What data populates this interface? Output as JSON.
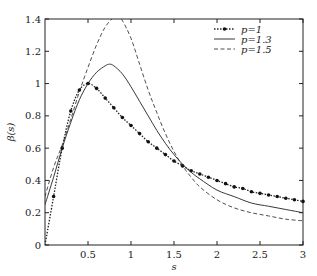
{
  "chart_data": {
    "type": "line",
    "title": "",
    "xlabel": "s",
    "ylabel": "β(s)",
    "xlim": [
      0,
      3
    ],
    "ylim": [
      0,
      1.4
    ],
    "grid": false,
    "legend_position": "upper right",
    "x_ticks": [
      "0.5",
      "1",
      "1.5",
      "2",
      "2.5",
      "3"
    ],
    "y_ticks": [
      "0",
      "0.2",
      "0.4",
      "0.6",
      "0.8",
      "1",
      "1.2",
      "1.4"
    ],
    "series": [
      {
        "name": "p=1",
        "style": "dotted-markers",
        "x": [
          0,
          0.1,
          0.2,
          0.3,
          0.4,
          0.5,
          0.6,
          0.7,
          0.8,
          0.9,
          1.0,
          1.1,
          1.2,
          1.3,
          1.4,
          1.5,
          1.6,
          1.7,
          1.8,
          1.9,
          2.0,
          2.1,
          2.2,
          2.3,
          2.4,
          2.5,
          2.6,
          2.7,
          2.8,
          2.9,
          3.0
        ],
        "values": [
          0,
          0.3,
          0.6,
          0.83,
          0.96,
          1.0,
          0.97,
          0.91,
          0.85,
          0.79,
          0.74,
          0.69,
          0.64,
          0.6,
          0.56,
          0.52,
          0.49,
          0.46,
          0.44,
          0.42,
          0.4,
          0.38,
          0.36,
          0.35,
          0.33,
          0.32,
          0.31,
          0.3,
          0.29,
          0.28,
          0.27
        ]
      },
      {
        "name": "p=1.3",
        "style": "solid",
        "x": [
          0,
          0.1,
          0.2,
          0.3,
          0.4,
          0.5,
          0.6,
          0.7,
          0.75,
          0.8,
          0.9,
          1.0,
          1.1,
          1.2,
          1.3,
          1.4,
          1.5,
          1.6,
          1.7,
          1.8,
          2.0,
          2.2,
          2.4,
          2.6,
          2.8,
          3.0
        ],
        "values": [
          0.25,
          0.42,
          0.6,
          0.76,
          0.9,
          1.0,
          1.07,
          1.11,
          1.12,
          1.11,
          1.06,
          0.98,
          0.89,
          0.8,
          0.71,
          0.63,
          0.56,
          0.5,
          0.45,
          0.41,
          0.34,
          0.3,
          0.26,
          0.24,
          0.22,
          0.2
        ]
      },
      {
        "name": "p=1.5",
        "style": "dashed",
        "x": [
          0,
          0.1,
          0.2,
          0.3,
          0.4,
          0.5,
          0.6,
          0.7,
          0.8,
          0.85,
          0.9,
          1.0,
          1.1,
          1.2,
          1.3,
          1.4,
          1.5,
          1.6,
          1.7,
          1.8,
          2.0,
          2.2,
          2.4,
          2.6,
          2.8,
          3.0
        ],
        "values": [
          0.3,
          0.48,
          0.62,
          0.78,
          0.95,
          1.1,
          1.24,
          1.35,
          1.41,
          1.41,
          1.39,
          1.28,
          1.12,
          0.96,
          0.82,
          0.69,
          0.58,
          0.49,
          0.42,
          0.36,
          0.28,
          0.23,
          0.2,
          0.18,
          0.16,
          0.15
        ]
      }
    ]
  },
  "legend": {
    "items": [
      {
        "label": "p=1",
        "style": "dotted-markers"
      },
      {
        "label": "p=1.3",
        "style": "solid"
      },
      {
        "label": "p=1.5",
        "style": "dashed"
      }
    ]
  },
  "colors": {
    "line": "#222222",
    "axis": "#222222",
    "background": "#ffffff"
  }
}
